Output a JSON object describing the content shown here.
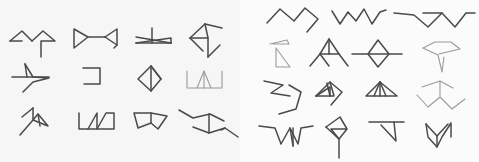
{
  "figure": {
    "colors": {
      "ink_dark": "#4a4a4a",
      "ink_light": "#9a9a9a",
      "left_bg": "#f6f6f6",
      "right_bg": "#fbfbfb"
    },
    "panels": [
      {
        "id": "left",
        "rows": 3,
        "cols": 4,
        "glyphs": [
          {
            "r": 0,
            "c": 0,
            "shade": "dark",
            "paths": [
              "M10 41 L22 31 L32 41",
              "M32 41 L43 31 L55 41 L41 41 L41 57",
              "M10 41 L22 41"
            ]
          },
          {
            "r": 0,
            "c": 1,
            "shade": "dark",
            "paths": [
              "M74 48 L74 29 L88 37 L74 48",
              "M88 37 L105 37",
              "M105 37 L117 29 L117 45",
              "M105 37 L117 45 L114 48"
            ]
          },
          {
            "r": 0,
            "c": 2,
            "shade": "dark",
            "paths": [
              "M136 43 L171 43",
              "M136 43 L171 38 L171 43",
              "M136 37 L171 43",
              "M152 28 L152 43"
            ]
          },
          {
            "r": 0,
            "c": 3,
            "shade": "dark",
            "paths": [
              "M190 38 L205 24",
              "M205 24 L222 28",
              "M190 38 L208 38 L208 57",
              "M190 38 L203 51",
              "M208 57 L220 45",
              "M208 38 L205 24"
            ]
          },
          {
            "r": 1,
            "c": 0,
            "shade": "dark",
            "paths": [
              "M12 77 L49 77",
              "M25 64 L33 77 L49 78 L33 82 L23 92",
              "M25 64 L27 77"
            ]
          },
          {
            "r": 1,
            "c": 1,
            "shade": "dark",
            "paths": [
              "M83 68 L100 68 L100 84 L84 84"
            ]
          },
          {
            "r": 1,
            "c": 2,
            "shade": "dark",
            "paths": [
              "M138 79 L151 66 L161 79 L151 91 L138 79",
              "M151 66 L151 91",
              "M151 66 L161 79"
            ]
          },
          {
            "r": 1,
            "c": 3,
            "shade": "light",
            "paths": [
              "M187 71 L187 88 L222 88 L222 71",
              "M197 88 L204 71 L211 88",
              "M204 71 L204 88"
            ]
          },
          {
            "r": 2,
            "c": 0,
            "shade": "dark",
            "paths": [
              "M22 117 L33 108",
              "M33 108 L33 120 L20 135",
              "M33 120 L48 126 L38 114 L33 120",
              "M38 114 L40 126"
            ]
          },
          {
            "r": 2,
            "c": 1,
            "shade": "dark",
            "paths": [
              "M79 113 L79 129 L114 129 L114 113 L106 113 L97 129",
              "M97 129 L97 113 L88 129"
            ]
          },
          {
            "r": 2,
            "c": 2,
            "shade": "dark",
            "paths": [
              "M134 113 L138 128 L151 123 L158 129 L167 116 L151 113 L134 113",
              "M151 113 L151 123"
            ]
          },
          {
            "r": 2,
            "c": 3,
            "shade": "dark",
            "paths": [
              "M179 110 L193 118 L210 114 L224 121",
              "M193 127 L209 133 L225 128 L238 137",
              "M209 114 L209 133",
              "M225 128 L221 130"
            ]
          }
        ]
      },
      {
        "id": "right",
        "rows": 4,
        "cols": 4,
        "glyphs": [
          {
            "r": 0,
            "c": 0,
            "shade": "dark",
            "paths": [
              "M267 23 L280 9 L294 21 L305 8 L318 19 L307 32"
            ]
          },
          {
            "r": 0,
            "c": 1,
            "shade": "dark",
            "paths": [
              "M332 11 L340 24 L348 12 L356 21 L364 9 L372 24 L380 12 L386 10"
            ]
          },
          {
            "r": 0,
            "c": 2,
            "shade": "dark",
            "paths": [
              "M394 13 L414 15 L428 27 L442 13 L423 13",
              "M442 13 L455 27 L466 13 L475 13"
            ]
          },
          {
            "r": 1,
            "c": 0,
            "shade": "light",
            "paths": [
              "M270 44 L287 40 L289 44 L273 44",
              "M276 48 L276 67 L290 67 L276 48"
            ]
          },
          {
            "r": 1,
            "c": 1,
            "shade": "dark",
            "paths": [
              "M310 66 L320 54 L329 66",
              "M320 54 L329 39 L339 54 L348 66",
              "M320 54 L339 54",
              "M329 39 L329 54"
            ]
          },
          {
            "r": 1,
            "c": 2,
            "shade": "dark",
            "paths": [
              "M352 54 L402 54",
              "M368 54 L378 40 L389 54 L378 67 L368 54"
            ]
          },
          {
            "r": 1,
            "c": 3,
            "shade": "light",
            "paths": [
              "M423 48 L435 42 L451 42 L460 49 L439 54",
              "M423 48 L438 55 L442 72 L444 57"
            ]
          },
          {
            "r": 2,
            "c": 0,
            "shade": "dark",
            "paths": [
              "M264 81 L283 85 L271 93 L290 96",
              "M289 85 L301 92 L296 109 L279 114"
            ]
          },
          {
            "r": 2,
            "c": 1,
            "shade": "dark",
            "paths": [
              "M316 96 L330 82 L342 92 L331 105",
              "M316 96 L330 87 L330 96",
              "M330 82 L334 96 L316 96",
              "M327 83 L330 96"
            ]
          },
          {
            "r": 2,
            "c": 2,
            "shade": "dark",
            "paths": [
              "M366 96 L380 82 L397 96 L366 96",
              "M380 82 L374 96",
              "M380 82 L386 96",
              "M380 82 L380 96"
            ]
          },
          {
            "r": 2,
            "c": 3,
            "shade": "light",
            "paths": [
              "M422 87 L440 81 L453 88",
              "M440 81 L440 96",
              "M417 95 L428 107 L440 97 L452 109 L465 99"
            ]
          },
          {
            "r": 3,
            "c": 0,
            "shade": "dark",
            "paths": [
              "M259 126 L275 128 L281 144 L290 128 L293 146",
              "M290 128 L298 144 L301 128 L313 126",
              "M293 146 L293 128"
            ]
          },
          {
            "r": 3,
            "c": 1,
            "shade": "dark",
            "paths": [
              "M326 127 L340 117 L347 129 L331 129 L339 139 L347 129",
              "M339 139 L339 158",
              "M326 127 L339 139"
            ]
          },
          {
            "r": 3,
            "c": 2,
            "shade": "dark",
            "paths": [
              "M369 122 L404 122",
              "M381 125 L396 141 L394 122"
            ]
          },
          {
            "r": 3,
            "c": 3,
            "shade": "dark",
            "paths": [
              "M426 124 L428 137 L437 147 L442 137 L451 123 L451 137",
              "M426 124 L437 136 L448 124",
              "M437 136 L437 147"
            ]
          }
        ]
      }
    ]
  }
}
